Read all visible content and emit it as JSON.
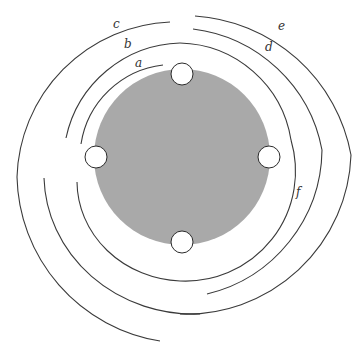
{
  "diagram": {
    "colors": {
      "disk": "#a9a9a9",
      "stroke": "#3a3a3a",
      "node_fill": "#ffffff",
      "background": "#ffffff"
    },
    "disk": {
      "cx": 182,
      "cy": 157,
      "r": 88
    },
    "nodes": [
      {
        "id": "top",
        "cx": 182,
        "cy": 74,
        "r": 11
      },
      {
        "id": "left",
        "cx": 96,
        "cy": 157,
        "r": 11
      },
      {
        "id": "right",
        "cx": 269,
        "cy": 157,
        "r": 11
      },
      {
        "id": "bottom",
        "cx": 182,
        "cy": 242,
        "r": 11
      }
    ],
    "labels": [
      {
        "id": "a",
        "text": "a",
        "x": 135,
        "y": 67
      },
      {
        "id": "b",
        "text": "b",
        "x": 124,
        "y": 48
      },
      {
        "id": "c",
        "text": "c",
        "x": 113,
        "y": 28
      },
      {
        "id": "d",
        "text": "d",
        "x": 265,
        "y": 51
      },
      {
        "id": "e",
        "text": "e",
        "x": 278,
        "y": 30
      },
      {
        "id": "f",
        "text": "f",
        "x": 296,
        "y": 196
      }
    ]
  }
}
